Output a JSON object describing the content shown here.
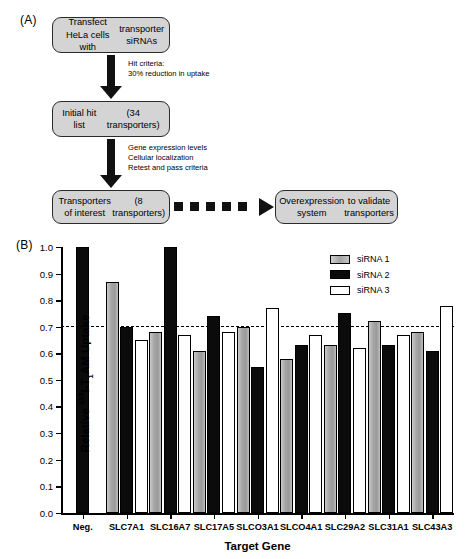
{
  "panels": {
    "a_label": "(A)",
    "b_label": "(B)"
  },
  "flowchart": {
    "boxes": [
      {
        "id": "transfect",
        "text": "Transfect HeLa cells with\ntransporter siRNAs"
      },
      {
        "id": "hitlist",
        "text": "Initial hit list\n(34 transporters)"
      },
      {
        "id": "interest",
        "text": "Transporters of interest\n(8 transporters)"
      },
      {
        "id": "overexpress",
        "text": "Overexpression system\nto validate transporters"
      }
    ],
    "annotations": [
      {
        "id": "criteria-1",
        "text": "Hit criteria:\n30% reduction in uptake"
      },
      {
        "id": "criteria-2",
        "text": "Gene expression levels\nCellular localization\nRetest and pass criteria"
      }
    ],
    "box_fill": "#d4d4d4",
    "box_stroke": "#2b2b2b",
    "arrow_color": "#111111"
  },
  "chart_data": {
    "type": "bar",
    "title": "",
    "xlabel": "Target Gene",
    "ylabel": "Relative 125I-T1AM Uptake",
    "ylabel_parts": {
      "prefix": "Relative ",
      "superscript": "125",
      "mid": "I-T",
      "subscript": "1",
      "suffix": "AM Uptake"
    },
    "ylim": [
      0.0,
      1.0
    ],
    "ytick_labels": [
      "0.0",
      "0.1",
      "0.2",
      "0.3",
      "0.4",
      "0.5",
      "0.6",
      "0.7",
      "0.8",
      "0.9",
      "1.0"
    ],
    "ytick_values": [
      0.0,
      0.1,
      0.2,
      0.3,
      0.4,
      0.5,
      0.6,
      0.7,
      0.8,
      0.9,
      1.0
    ],
    "grid": false,
    "threshold": {
      "value": 0.7,
      "style": "dashed",
      "label": ""
    },
    "legend_position": "top-right",
    "categories": [
      "Neg.",
      "SLC7A1",
      "SLC16A7",
      "SLC17A5",
      "SLCO3A1",
      "SLCO4A1",
      "SLC29A2",
      "SLC31A1",
      "SLC43A3"
    ],
    "series": [
      {
        "name": "siRNA 1",
        "color": "#a8a8a8",
        "values": [
          null,
          0.87,
          0.68,
          0.61,
          0.7,
          0.58,
          0.63,
          0.72,
          0.68
        ]
      },
      {
        "name": "siRNA 2",
        "color": "#0b0b0b",
        "values": [
          1.0,
          0.7,
          1.0,
          0.74,
          0.55,
          0.63,
          0.75,
          0.63,
          0.61
        ]
      },
      {
        "name": "siRNA 3",
        "color": "#ffffff",
        "values": [
          null,
          0.65,
          0.67,
          0.68,
          0.77,
          0.67,
          0.62,
          0.67,
          0.78
        ]
      }
    ]
  }
}
